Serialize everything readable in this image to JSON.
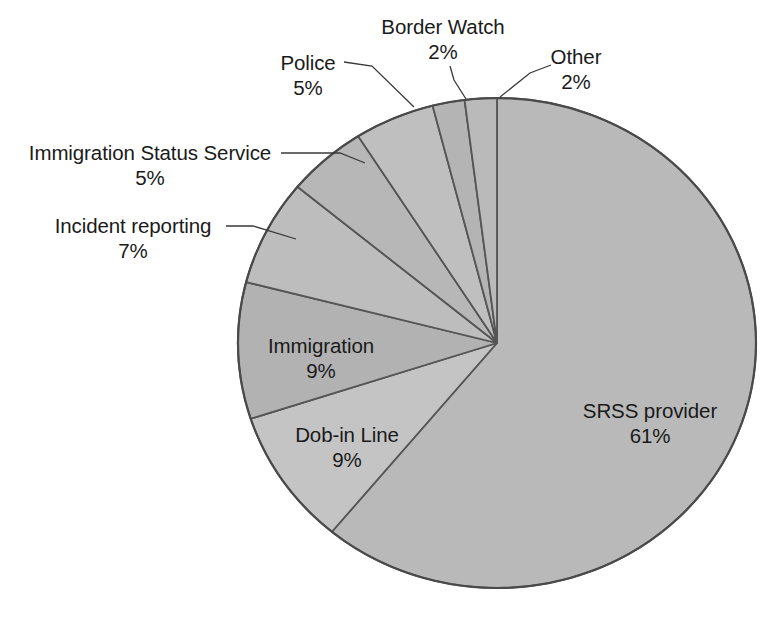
{
  "chart_data": {
    "type": "pie",
    "title": "",
    "subtitle": "",
    "xlabel": "",
    "ylabel": "",
    "legend_position": "none",
    "grid": false,
    "units": "percent",
    "start_angle_deg": 0,
    "direction": "clockwise",
    "categories": [
      "SRSS provider",
      "Dob-in Line",
      "Immigration",
      "Incident reporting",
      "Immigration Status Service",
      "Police",
      "Border Watch",
      "Other"
    ],
    "values": [
      61,
      9,
      9,
      7,
      5,
      5,
      2,
      2
    ],
    "slices": [
      {
        "label": "SRSS provider",
        "value": 61,
        "percent_text": "61%",
        "fill": "#b9b9b9",
        "label_placement": "inside",
        "label_x": 650,
        "label_y": 398,
        "leader": false
      },
      {
        "label": "Dob-in Line",
        "value": 9,
        "percent_text": "9%",
        "fill": "#c4c4c4",
        "label_placement": "inside",
        "label_x": 347,
        "label_y": 422,
        "leader": false
      },
      {
        "label": "Immigration",
        "value": 9,
        "percent_text": "9%",
        "fill": "#b2b2b2",
        "label_placement": "inside",
        "label_x": 321,
        "label_y": 333,
        "leader": false
      },
      {
        "label": "Incident reporting",
        "value": 7,
        "percent_text": "7%",
        "fill": "#bdbdbd",
        "label_placement": "outside-left",
        "label_x": 133,
        "label_y": 213,
        "leader": true,
        "leader_points": "226,226 253,226 296,239"
      },
      {
        "label": "Immigration Status Service",
        "value": 5,
        "percent_text": "5%",
        "fill": "#b7b7b7",
        "label_placement": "outside-left",
        "label_x": 150,
        "label_y": 140,
        "leader": true,
        "leader_points": "281,153 340,153 365,163"
      },
      {
        "label": "Police",
        "value": 5,
        "percent_text": "5%",
        "fill": "#bfbfbf",
        "label_placement": "outside-top",
        "label_x": 308,
        "label_y": 50,
        "leader": true,
        "leader_points": "344,62 372,66 414,107"
      },
      {
        "label": "Border Watch",
        "value": 2,
        "percent_text": "2%",
        "fill": "#b4b4b4",
        "label_placement": "outside-top",
        "label_x": 443,
        "label_y": 14,
        "leader": true,
        "leader_points": "450,66 454,80 466,99"
      },
      {
        "label": "Other",
        "value": 2,
        "percent_text": "2%",
        "fill": "#bababa",
        "label_placement": "outside-top",
        "label_x": 576,
        "label_y": 44,
        "leader": true,
        "leader_points": "551,65 530,73 500,97"
      }
    ],
    "geometry": {
      "center_x": 497,
      "center_y": 343,
      "radius_x": 259,
      "radius_y": 245,
      "outline_color": "#4a4a4a",
      "divider_color": "#555555"
    }
  }
}
